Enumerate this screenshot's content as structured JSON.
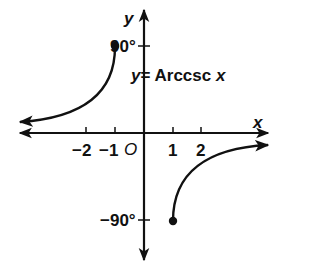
{
  "figure": {
    "type": "function-graph",
    "equation": {
      "lhs": "y",
      "eq": "= Arccsc ",
      "var": "x"
    },
    "axes": {
      "x_label": "x",
      "y_label": "y",
      "origin_label": "O",
      "x_ticks": [
        {
          "label": "−2",
          "value": -2
        },
        {
          "label": "−1",
          "value": -1
        },
        {
          "label": "1",
          "value": 1
        },
        {
          "label": "2",
          "value": 2
        }
      ],
      "y_ticks": [
        {
          "label": "90°",
          "value": 90
        },
        {
          "label": "−90°",
          "value": -90
        }
      ]
    },
    "branches": [
      {
        "name": "left-branch",
        "domain": "x ≤ −1",
        "endpoint": {
          "x": -1,
          "y": "90°",
          "closed": true
        },
        "direction": "toward -∞ approaching 0"
      },
      {
        "name": "right-branch",
        "domain": "x ≥ 1",
        "endpoint": {
          "x": 1,
          "y": "−90°",
          "closed": true
        },
        "direction": "toward +∞ approaching 0"
      }
    ],
    "colors": {
      "stroke": "#111111",
      "background": "#ffffff"
    }
  }
}
